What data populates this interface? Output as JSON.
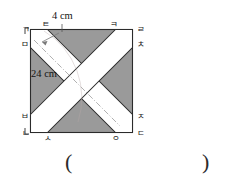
{
  "figure": {
    "type": "geometry-diagram",
    "shape": "square-with-two-crossing-white-bands",
    "square_fill": "#9a9a9a",
    "band_fill": "#ffffff",
    "stroke": "#2b2b2b",
    "dimensions": {
      "band_width_label": "4 cm",
      "band_width_value": 4,
      "diagonal_label": "24 cm",
      "diagonal_value": 24,
      "unit": "cm"
    },
    "vertex_labels": {
      "top_left_corner": "ㄱ",
      "bottom_left_corner": "ㄴ",
      "bottom_right_corner": "ㄷ",
      "top_right_corner": "ㄹ",
      "left_upper": "ㅁ",
      "left_lower": "ㅂ",
      "bottom_left_mid": "ㅅ",
      "bottom_right_mid": "ㅇ",
      "right_lower": "ㅈ",
      "right_upper": "ㅊ",
      "top_right_mid": "ㅋ",
      "top_left_mid": "ㅌ"
    }
  },
  "answer": {
    "open_paren": "(",
    "close_paren": ")",
    "value": ""
  }
}
